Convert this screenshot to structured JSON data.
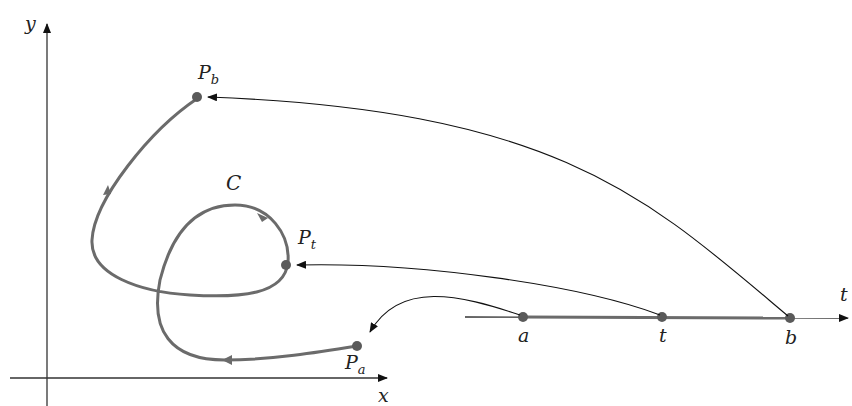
{
  "figure": {
    "axes": {
      "x_label": "x",
      "y_label": "y",
      "t_label": "t"
    },
    "curve_label": "C",
    "interval": {
      "start_label": "a",
      "mid_label": "t",
      "end_label": "b"
    },
    "points": [
      {
        "name": "P",
        "sub": "a"
      },
      {
        "name": "P",
        "sub": "t"
      },
      {
        "name": "P",
        "sub": "b"
      }
    ],
    "colors": {
      "curve": "#6b6b6b",
      "axis": "#333333",
      "arrow": "#111111",
      "dot": "#5a5a5a"
    }
  }
}
